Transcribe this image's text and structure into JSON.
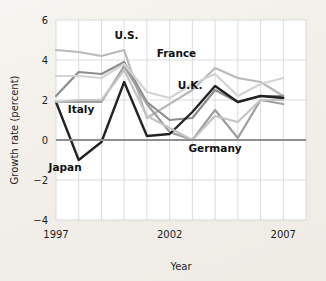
{
  "chart_data": {
    "type": "line",
    "title": "",
    "xlabel": "Year",
    "ylabel": "Growth rate (percent)",
    "x": [
      1997,
      1998,
      1999,
      2000,
      2001,
      2002,
      2003,
      2004,
      2005,
      2006,
      2007
    ],
    "xlim": [
      1997,
      2008
    ],
    "ylim": [
      -4,
      6
    ],
    "xticks": [
      1997,
      2002,
      2007
    ],
    "xticklabels": [
      "1997",
      "2002",
      "2007"
    ],
    "yticks": [
      -4,
      -2,
      0,
      2,
      4,
      6
    ],
    "yticklabels": [
      "−4",
      "−2",
      "0",
      "2",
      "4",
      "6"
    ],
    "grid": true,
    "gridlines_vertical_every": 1,
    "legend": "inline-labels",
    "zero_reference_line": 0,
    "series": [
      {
        "name": "U.S.",
        "color": "#b9b9b9",
        "width": 2.2,
        "label_x": 2000.1,
        "label_y": 5.05,
        "values": [
          4.5,
          4.4,
          4.2,
          4.5,
          1.1,
          1.8,
          2.5,
          3.6,
          3.1,
          2.9,
          2.2
        ]
      },
      {
        "name": "France",
        "color": "#8c8c8c",
        "width": 2.2,
        "label_x": 2002.3,
        "label_y": 4.15,
        "values": [
          2.2,
          3.4,
          3.3,
          3.9,
          1.9,
          1.0,
          1.1,
          2.5,
          1.9,
          2.2,
          2.2
        ]
      },
      {
        "name": "Italy",
        "color": "#9e9e9e",
        "width": 2.2,
        "label_x": 1998.1,
        "label_y": 1.35,
        "values": [
          1.9,
          1.9,
          1.9,
          3.7,
          1.8,
          0.4,
          0.0,
          1.5,
          0.1,
          2.0,
          1.8
        ]
      },
      {
        "name": "Japan",
        "color": "#232323",
        "width": 2.4,
        "label_x": 1997.4,
        "label_y": -1.55,
        "values": [
          1.9,
          -1.0,
          -0.1,
          2.9,
          0.2,
          0.3,
          1.4,
          2.7,
          1.9,
          2.2,
          2.1
        ]
      },
      {
        "name": "U.K.",
        "color": "#d3d3d3",
        "width": 2.2,
        "label_x": 2002.9,
        "label_y": 2.55,
        "values": [
          3.2,
          3.2,
          3.1,
          3.8,
          2.4,
          2.1,
          2.8,
          3.3,
          2.2,
          2.8,
          3.1
        ]
      },
      {
        "name": "Germany",
        "color": "#c4c4c4",
        "width": 2.2,
        "label_x": 2004.0,
        "label_y": -0.62,
        "values": [
          1.9,
          2.0,
          2.0,
          3.5,
          1.2,
          0.6,
          0.0,
          1.2,
          0.9,
          2.0,
          2.0
        ]
      }
    ]
  },
  "axis": {
    "ylabel": "Growth rate (percent)",
    "xlabel": "Year",
    "ytick_labels": [
      "6",
      "4",
      "2",
      "0",
      "−2",
      "−4"
    ],
    "xtick_labels": [
      "1997",
      "2002",
      "2007"
    ]
  }
}
